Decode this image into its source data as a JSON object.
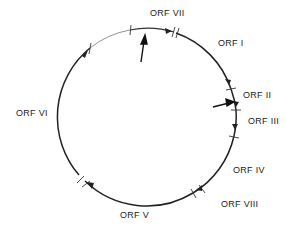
{
  "diagram": {
    "type": "circular-genome-map",
    "circle": {
      "cx": 147,
      "cy": 117,
      "r": 89
    },
    "labels": [
      {
        "id": "orf-vii",
        "text": "ORF VII",
        "x": 150,
        "y": 16
      },
      {
        "id": "orf-i",
        "text": "ORF I",
        "x": 218,
        "y": 46
      },
      {
        "id": "orf-ii",
        "text": "ORF II",
        "x": 243,
        "y": 98
      },
      {
        "id": "orf-iii",
        "text": "ORF III",
        "x": 248,
        "y": 124
      },
      {
        "id": "orf-iv",
        "text": "ORF IV",
        "x": 233,
        "y": 173
      },
      {
        "id": "orf-viii",
        "text": "ORF VIII",
        "x": 221,
        "y": 207
      },
      {
        "id": "orf-v",
        "text": "ORF V",
        "x": 120,
        "y": 218
      },
      {
        "id": "orf-vi",
        "text": "ORF VI",
        "x": 16,
        "y": 116
      }
    ],
    "colors": {
      "line": "#222222",
      "thin_line": "#666666"
    }
  }
}
